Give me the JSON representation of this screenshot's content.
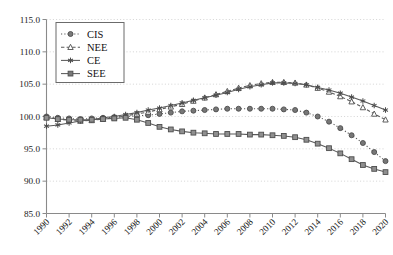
{
  "chart_data": {
    "type": "line",
    "title": "",
    "xlabel": "",
    "ylabel": "",
    "xlim": [
      1990,
      2020
    ],
    "ylim": [
      85.0,
      115.0
    ],
    "yticks": [
      85.0,
      90.0,
      95.0,
      100.0,
      105.0,
      110.0,
      115.0
    ],
    "ytick_labels": [
      "85.0",
      "90.0",
      "95.0",
      "100.0",
      "105.0",
      "110.0",
      "115.0"
    ],
    "xticks": [
      1990,
      1992,
      1994,
      1996,
      1998,
      2000,
      2002,
      2004,
      2006,
      2008,
      2010,
      2012,
      2014,
      2016,
      2018,
      2020
    ],
    "xtick_labels": [
      "1990",
      "1992",
      "1994",
      "1996",
      "1998",
      "2000",
      "2002",
      "2004",
      "2006",
      "2008",
      "2010",
      "2012",
      "2014",
      "2016",
      "2018",
      "2020"
    ],
    "x": [
      1990,
      1991,
      1992,
      1993,
      1994,
      1995,
      1996,
      1997,
      1998,
      1999,
      2000,
      2001,
      2002,
      2003,
      2004,
      2005,
      2006,
      2007,
      2008,
      2009,
      2010,
      2011,
      2012,
      2013,
      2014,
      2015,
      2016,
      2017,
      2018,
      2019,
      2020
    ],
    "grid": true,
    "legend_position": "upper-left",
    "series": [
      {
        "name": "CIS",
        "marker": "filled-circle",
        "linestyle": "dotted",
        "color": "#777777",
        "values": [
          100.0,
          99.8,
          99.7,
          99.6,
          99.7,
          99.8,
          99.9,
          100.0,
          100.1,
          100.2,
          100.4,
          100.6,
          100.8,
          100.9,
          101.0,
          101.1,
          101.2,
          101.2,
          101.2,
          101.2,
          101.2,
          101.1,
          101.0,
          100.6,
          100.0,
          99.2,
          98.2,
          97.1,
          95.9,
          94.5,
          93.1
        ]
      },
      {
        "name": "NEE",
        "marker": "open-triangle",
        "linestyle": "dashed",
        "color": "#777777",
        "values": [
          99.9,
          99.6,
          99.4,
          99.3,
          99.4,
          99.6,
          99.8,
          100.1,
          100.4,
          100.7,
          101.1,
          101.5,
          101.9,
          102.4,
          102.9,
          103.4,
          103.9,
          104.4,
          104.8,
          105.1,
          105.3,
          105.3,
          105.2,
          104.9,
          104.4,
          103.8,
          103.1,
          102.3,
          101.4,
          100.4,
          99.5
        ]
      },
      {
        "name": "CE",
        "marker": "asterisk",
        "linestyle": "solid",
        "color": "#595959",
        "values": [
          98.5,
          98.7,
          99.0,
          99.3,
          99.5,
          99.8,
          100.0,
          100.3,
          100.6,
          101.0,
          101.3,
          101.7,
          102.1,
          102.5,
          102.9,
          103.3,
          103.7,
          104.2,
          104.6,
          104.9,
          105.2,
          105.2,
          105.1,
          104.9,
          104.5,
          104.1,
          103.6,
          103.0,
          102.4,
          101.7,
          101.0
        ]
      },
      {
        "name": "SEE",
        "marker": "filled-square",
        "linestyle": "solid",
        "color": "#8f8f8f",
        "values": [
          99.8,
          99.6,
          99.5,
          99.5,
          99.5,
          99.6,
          99.7,
          99.8,
          99.5,
          99.0,
          98.4,
          98.0,
          97.7,
          97.5,
          97.4,
          97.3,
          97.3,
          97.3,
          97.2,
          97.2,
          97.1,
          97.0,
          96.8,
          96.4,
          95.8,
          95.1,
          94.3,
          93.4,
          92.5,
          91.9,
          91.4
        ]
      }
    ],
    "legend": [
      {
        "label": "CIS",
        "marker": "filled-circle",
        "linestyle": "dotted"
      },
      {
        "label": "NEE",
        "marker": "open-triangle",
        "linestyle": "dashed"
      },
      {
        "label": "CE",
        "marker": "asterisk",
        "linestyle": "solid"
      },
      {
        "label": "SEE",
        "marker": "filled-square",
        "linestyle": "solid"
      }
    ]
  }
}
